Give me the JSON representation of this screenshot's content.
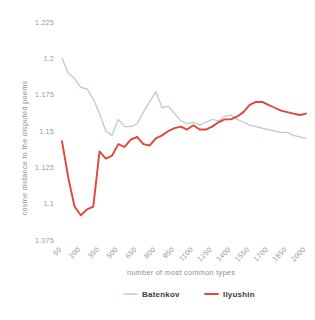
{
  "chart_data": {
    "type": "line",
    "title": "",
    "xlabel": "number of most common types",
    "ylabel": "cosine distance to the disputed poems",
    "grid": false,
    "legend_position": "bottom",
    "xlim": [
      50,
      2000
    ],
    "ylim": [
      1.075,
      1.225
    ],
    "yticks": [
      "1.075",
      "1.1",
      "1.125",
      "1.15",
      "1.175",
      "1.2",
      "1.225"
    ],
    "ytick_values": [
      1.075,
      1.1,
      1.125,
      1.15,
      1.175,
      1.2,
      1.225
    ],
    "xticks": [
      "50",
      "200",
      "350",
      "500",
      "650",
      "800",
      "950",
      "1100",
      "1250",
      "1400",
      "1550",
      "1700",
      "1850",
      "2000"
    ],
    "xtick_values": [
      50,
      200,
      350,
      500,
      650,
      800,
      950,
      1100,
      1250,
      1400,
      1550,
      1700,
      1850,
      2000
    ],
    "x": [
      50,
      100,
      150,
      200,
      250,
      300,
      350,
      400,
      450,
      500,
      550,
      600,
      650,
      700,
      750,
      800,
      850,
      900,
      950,
      1000,
      1050,
      1100,
      1150,
      1200,
      1250,
      1300,
      1350,
      1400,
      1450,
      1500,
      1550,
      1600,
      1650,
      1700,
      1750,
      1800,
      1850,
      1900,
      1950,
      2000
    ],
    "series": [
      {
        "name": "Batenkov",
        "color": "#b9ccd0",
        "values": [
          1.2,
          1.19,
          1.186,
          1.18,
          1.179,
          1.172,
          1.162,
          1.15,
          1.147,
          1.158,
          1.153,
          1.153,
          1.155,
          1.163,
          1.17,
          1.177,
          1.166,
          1.167,
          1.162,
          1.157,
          1.155,
          1.156,
          1.154,
          1.156,
          1.158,
          1.157,
          1.16,
          1.161,
          1.158,
          1.156,
          1.154,
          1.153,
          1.152,
          1.151,
          1.15,
          1.149,
          1.149,
          1.147,
          1.146,
          1.145
        ]
      },
      {
        "name": "Ilyushin",
        "color": "#e3453a",
        "values": [
          1.143,
          1.118,
          1.098,
          1.092,
          1.096,
          1.098,
          1.136,
          1.131,
          1.133,
          1.141,
          1.139,
          1.144,
          1.146,
          1.141,
          1.14,
          1.145,
          1.147,
          1.15,
          1.152,
          1.153,
          1.151,
          1.154,
          1.151,
          1.151,
          1.153,
          1.156,
          1.158,
          1.158,
          1.16,
          1.163,
          1.168,
          1.17,
          1.17,
          1.168,
          1.166,
          1.164,
          1.163,
          1.162,
          1.161,
          1.162
        ]
      }
    ]
  },
  "legend": {
    "items": [
      {
        "label": "Batenkov",
        "color": "#b9ccd0"
      },
      {
        "label": "Ilyushin",
        "color": "#e3453a"
      }
    ]
  },
  "axes": {
    "x_title": "number of most common types",
    "y_title": "cosine distance to the disputed poems"
  }
}
